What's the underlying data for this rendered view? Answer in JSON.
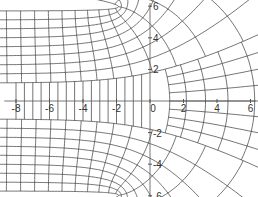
{
  "chart_data": {
    "type": "line",
    "title": "",
    "subtitle": "",
    "xlabel": "",
    "ylabel": "",
    "xlim": [
      -8.7,
      6.3
    ],
    "ylim": [
      -6.3,
      6.2
    ],
    "grid": false,
    "legend": null,
    "axes": {
      "x_axis_at_y": 0,
      "y_axis_at_x": 0,
      "x_ticks": [
        -8,
        -6,
        -4,
        -2,
        0,
        2,
        4,
        6
      ],
      "x_tick_labels": [
        "-8",
        "-6",
        "-4",
        "-2",
        "0",
        "2",
        "4",
        "6"
      ],
      "y_ticks": [
        6,
        4,
        2,
        -2,
        -4,
        -6
      ],
      "y_tick_labels": [
        "6",
        "4",
        "2",
        "-2",
        "-4",
        "-6"
      ]
    },
    "mesh": {
      "map": "w = z + exp(z)",
      "line_color": "#3a3a3a",
      "axis_color": "#555555",
      "u_range": [
        -9,
        2.2
      ],
      "u_step": 0.45,
      "v_levels_upper": [
        0.6,
        0.9,
        1.2,
        1.5,
        1.8,
        2.1,
        2.4,
        2.7,
        3.0
      ],
      "v_levels_lower": [
        -0.6,
        -0.9,
        -1.2,
        -1.5,
        -1.8,
        -2.1,
        -2.4,
        -2.7,
        -3.0
      ],
      "channel_vertical_x": [
        -8,
        -7.5,
        -7,
        -6.5,
        -6,
        -5.5,
        -5,
        -4.5,
        -4,
        -3.5,
        -3,
        -2.5,
        -2,
        -1.5,
        -1,
        -0.5
      ]
    }
  }
}
